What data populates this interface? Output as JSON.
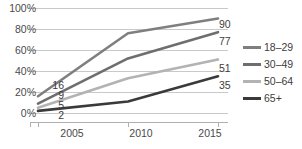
{
  "chart_data": {
    "type": "line",
    "title": "",
    "subtitle": "",
    "xlabel": "",
    "ylabel": "",
    "x": [
      "2005",
      "2010",
      "2015"
    ],
    "categories": [
      "2005",
      "2010",
      "2015"
    ],
    "ylim": [
      0,
      100
    ],
    "xlim": [
      "2005",
      "2015"
    ],
    "y_ticks": [
      0,
      20,
      40,
      60,
      80,
      100
    ],
    "y_tick_labels": [
      "0%",
      "20%",
      "40%",
      "60%",
      "80%",
      "100%"
    ],
    "x_tick_labels": [
      "2005",
      "2010",
      "2015"
    ],
    "grid": "horizontal",
    "legend_position": "right",
    "series": [
      {
        "name": "18–29",
        "color": "#7f7f7f",
        "values": [
          16,
          76,
          90
        ],
        "start_label": "16",
        "end_label": "90"
      },
      {
        "name": "30–49",
        "color": "#6e6e6e",
        "values": [
          9,
          52,
          77
        ],
        "start_label": "9",
        "end_label": "77"
      },
      {
        "name": "50–64",
        "color": "#b3b3b3",
        "values": [
          5,
          33,
          51
        ],
        "start_label": "5",
        "end_label": "51"
      },
      {
        "name": "65+",
        "color": "#3a3a3a",
        "values": [
          2,
          11,
          35
        ],
        "start_label": "2",
        "end_label": "35"
      }
    ],
    "start_labels": [
      "16",
      "9",
      "5",
      "2"
    ],
    "end_labels": [
      "90",
      "77",
      "51",
      "35"
    ]
  },
  "axis": {
    "y": {
      "t100": "100%",
      "t80": "80%",
      "t60": "60%",
      "t40": "40%",
      "t20": "20%",
      "t0": "0%"
    },
    "x": {
      "t2005": "2005",
      "t2010": "2010",
      "t2015": "2015"
    }
  },
  "labels": {
    "start": {
      "s0": "16",
      "s1": "9",
      "s2": "5",
      "s3": "2"
    },
    "end": {
      "e0": "90",
      "e1": "77",
      "e2": "51",
      "e3": "35"
    }
  },
  "legend": {
    "items": [
      {
        "label": "18–29",
        "color": "#7f7f7f"
      },
      {
        "label": "30–49",
        "color": "#6e6e6e"
      },
      {
        "label": "50–64",
        "color": "#b3b3b3"
      },
      {
        "label": "65+",
        "color": "#3a3a3a"
      }
    ]
  },
  "style": {
    "grid_color": "#c9c9c9",
    "axis_color": "#b0b0b0",
    "text_color": "#404040",
    "background": "#ffffff"
  }
}
